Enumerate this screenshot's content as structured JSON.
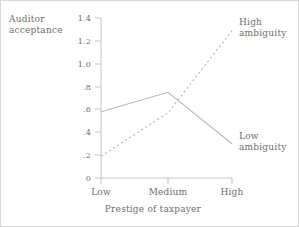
{
  "chart_data": {
    "type": "line",
    "title": "",
    "subtitle": "",
    "xlabel": "Prestige of taxpayer",
    "ylabel": "Auditor acceptance",
    "ylabel_lines": [
      "Auditor",
      "acceptance"
    ],
    "categories": [
      "Low",
      "Medium",
      "High"
    ],
    "ylim": [
      0,
      1.4
    ],
    "yticks": [
      0,
      0.2,
      0.4,
      0.6,
      0.8,
      1.0,
      1.2,
      1.4
    ],
    "ytick_labels": [
      "0",
      ".2",
      ".4",
      ".6",
      ".8",
      "1.0",
      "1.2",
      "1.4"
    ],
    "xtick_labels": [
      "Low",
      "Medium",
      "High"
    ],
    "grid": false,
    "legend_position": "inline-right",
    "series": [
      {
        "name": "Low ambiguity",
        "name_lines": [
          "Low",
          "ambiguity"
        ],
        "style": "solid",
        "color": "#b9b9b9",
        "values": [
          0.58,
          0.75,
          0.3
        ]
      },
      {
        "name": "High ambiguity",
        "name_lines": [
          "High",
          "ambiguity"
        ],
        "style": "dashed",
        "color": "#b9b9b9",
        "values": [
          0.19,
          0.57,
          1.29
        ]
      }
    ]
  },
  "axes": {
    "axis_color": "#c4c4c4",
    "text_color": "#6e6e6e"
  }
}
